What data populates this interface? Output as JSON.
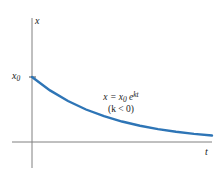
{
  "figure": {
    "background_color": "#ffffff",
    "width": 216,
    "height": 178
  },
  "axes": {
    "color": "#808080",
    "y_axis_label": "x",
    "x_axis_label": "t",
    "origin": {
      "x": 32,
      "y": 142
    },
    "y_axis_top": 18,
    "y_axis_bottom": 168,
    "x_axis_left": 12,
    "x_axis_right": 212
  },
  "intercept": {
    "label_main": "x",
    "label_subscript": "0",
    "value_y_pixel": 77,
    "tick_mark": true
  },
  "annotation": {
    "line1_prefix": "x = x",
    "line1_subscript": "0",
    "line1_base": " e",
    "line1_exponent": "kt",
    "line2": "(k < 0)"
  },
  "chart_data": {
    "type": "line",
    "title": "",
    "xlabel": "t",
    "ylabel": "x",
    "grid": false,
    "legend": null,
    "curve_color": "#2E75B6",
    "annotations": [
      "x = x₀ e^{kt}",
      "(k < 0)"
    ],
    "axis_ticks": {
      "x": [],
      "y": [
        "x₀"
      ]
    },
    "series": [
      {
        "name": "x = x0 e^(kt), k < 0",
        "x": [
          0,
          0.1,
          0.2,
          0.3,
          0.4,
          0.5,
          0.6,
          0.7,
          0.8,
          0.9,
          1.0
        ],
        "y": [
          1.0,
          0.794,
          0.63,
          0.5,
          0.397,
          0.315,
          0.25,
          0.198,
          0.157,
          0.125,
          0.099
        ]
      }
    ],
    "xlim": [
      0,
      1
    ],
    "ylim": [
      0,
      1.05
    ]
  }
}
